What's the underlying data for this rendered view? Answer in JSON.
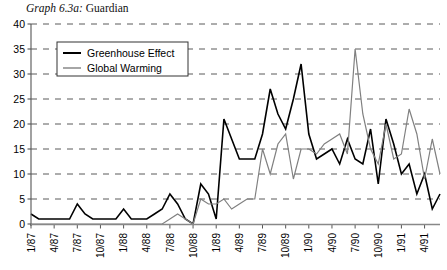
{
  "caption": {
    "label": "Graph 6.3a:",
    "text": "Guardian"
  },
  "chart_data": {
    "type": "line",
    "xlabel": "",
    "ylabel": "",
    "ylim": [
      0,
      40
    ],
    "ytick_step": 5,
    "yticks": [
      "0",
      "5",
      "10",
      "15",
      "20",
      "25",
      "30",
      "35",
      "40"
    ],
    "grid": true,
    "grid_style": "dashed-horizontal",
    "legend_position": "top-left-inside",
    "x": [
      "1/87",
      "2/87",
      "3/87",
      "4/87",
      "5/87",
      "6/87",
      "7/87",
      "8/87",
      "9/87",
      "10/87",
      "11/87",
      "12/87",
      "1/88",
      "2/88",
      "3/88",
      "4/88",
      "5/88",
      "6/88",
      "7/88",
      "8/88",
      "9/88",
      "10/88",
      "11/88",
      "12/88",
      "1/89",
      "2/89",
      "3/89",
      "4/89",
      "5/89",
      "6/89",
      "7/89",
      "8/89",
      "9/89",
      "10/89",
      "11/89",
      "12/89",
      "1/90",
      "2/90",
      "3/90",
      "4/90",
      "5/90",
      "6/90",
      "7/90",
      "8/90",
      "9/90",
      "10/90",
      "11/90",
      "12/90",
      "1/91",
      "2/91",
      "3/91",
      "4/91",
      "5/91",
      "6/91"
    ],
    "xticks": [
      "1/87",
      "4/87",
      "7/87",
      "10/87",
      "1/88",
      "4/88",
      "7/88",
      "10/88",
      "1/89",
      "4/89",
      "7/89",
      "10/89",
      "1/90",
      "4/90",
      "7/90",
      "10/90",
      "1/91",
      "4/91"
    ],
    "xtick_interval_months": 3,
    "series": [
      {
        "name": "Greenhouse Effect",
        "color": "#000000",
        "width": 1.6,
        "values": [
          2,
          1,
          1,
          1,
          1,
          1,
          4,
          2,
          1,
          1,
          1,
          1,
          3,
          1,
          1,
          1,
          2,
          3,
          6,
          4,
          1,
          0,
          8,
          6,
          1,
          21,
          17,
          13,
          13,
          13,
          18,
          27,
          22,
          19,
          25,
          32,
          18,
          13,
          14,
          15,
          12,
          17,
          13,
          12,
          19,
          8,
          21,
          16,
          10,
          12,
          6,
          10,
          3,
          6
        ]
      },
      {
        "name": "Global Warming",
        "color": "#808080",
        "width": 1.2,
        "values": [
          0,
          0,
          0,
          0,
          0,
          0,
          0,
          0,
          0,
          0,
          0,
          0,
          0,
          0,
          0,
          0,
          0,
          0,
          1,
          2,
          1,
          0,
          5,
          4,
          4,
          5,
          3,
          4,
          5,
          5,
          15,
          10,
          16,
          18,
          9,
          15,
          15,
          14,
          16,
          17,
          18,
          14,
          35,
          22,
          15,
          12,
          20,
          13,
          14,
          23,
          18,
          9,
          17,
          10
        ]
      }
    ]
  },
  "legend": {
    "items": [
      {
        "label": "Greenhouse Effect",
        "color": "#000000"
      },
      {
        "label": "Global Warming",
        "color": "#808080"
      }
    ]
  },
  "axes": {
    "y_axis_name": "y-axis",
    "x_axis_name": "x-axis"
  }
}
